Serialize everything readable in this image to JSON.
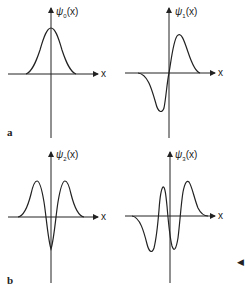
{
  "figure": {
    "panel_a": {
      "label": "a",
      "plots": [
        {
          "func": "ψ",
          "sub": "0",
          "arg": "(x)",
          "x_axis": "x"
        },
        {
          "func": "ψ",
          "sub": "1",
          "arg": "(x)",
          "x_axis": "x"
        }
      ]
    },
    "panel_b": {
      "label": "b",
      "plots": [
        {
          "func": "ψ",
          "sub": "2",
          "arg": "(x)",
          "x_axis": "x"
        },
        {
          "func": "ψ",
          "sub": "3",
          "arg": "(x)",
          "x_axis": "x"
        }
      ]
    },
    "marker": "◀"
  },
  "colors": {
    "ink": "#222222",
    "background": "#ffffff"
  }
}
